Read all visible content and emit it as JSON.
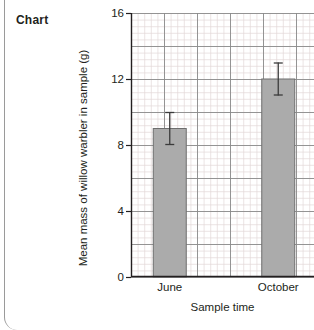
{
  "caption": "Chart",
  "chart_data": {
    "type": "bar",
    "title": "",
    "categories": [
      "June",
      "October"
    ],
    "values": [
      9.0,
      12.0
    ],
    "errors": [
      1.0,
      1.0
    ],
    "series": [
      {
        "name": "Mean mass of willow warbler in sample (g)",
        "values": [
          9.0,
          12.0
        ],
        "errors": [
          1.0,
          1.0
        ]
      }
    ],
    "xlabel": "Sample time",
    "ylabel": "Mean mass of willow warbler in sample (g)",
    "ylim": [
      0,
      16
    ],
    "yticks": [
      0,
      4,
      8,
      12,
      16
    ],
    "ytick_labels": [
      "0",
      "4",
      "8",
      "12",
      "16"
    ],
    "grid": true,
    "grid_major_step": 2,
    "grid_minor_divisions": 5,
    "legend": false,
    "legend_position": "none",
    "error_bars": true,
    "colors": {
      "bar_fill": "#ababab",
      "bar_edge": "#6e6e6e",
      "grid_major": "#8a8a8a",
      "grid_minor": "#e3d9d9",
      "axis": "#231f20",
      "error_bar": "#3b3b3b"
    }
  }
}
